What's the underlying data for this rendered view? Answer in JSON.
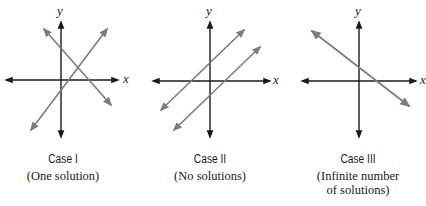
{
  "colors": {
    "axis": "#1a1a1a",
    "line": "#7d7d7d",
    "text": "#1a1a1a",
    "background": "#ffffff"
  },
  "axis_labels": {
    "x": "x",
    "y": "y"
  },
  "cases": [
    {
      "title": "Case I",
      "subtitle": "(One solution)",
      "description": "Two intersecting lines"
    },
    {
      "title": "Case II",
      "subtitle": "(No solutions)",
      "description": "Two parallel lines"
    },
    {
      "title": "Case III",
      "subtitle_line1": "(Infinite number",
      "subtitle_line2": "of solutions)",
      "description": "One coincident line"
    }
  ]
}
